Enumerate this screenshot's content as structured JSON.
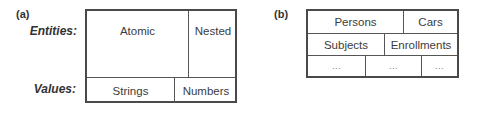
{
  "panel_a": {
    "label": "(a)",
    "row_labels": {
      "entities": "Entities:",
      "values": "Values:"
    },
    "entities": [
      {
        "label": "Atomic"
      },
      {
        "label": "Nested"
      }
    ],
    "values": [
      {
        "label": "Strings"
      },
      {
        "label": "Numbers"
      }
    ]
  },
  "panel_b": {
    "label": "(b)",
    "rows": [
      [
        {
          "label": "Persons"
        },
        {
          "label": "Cars"
        }
      ],
      [
        {
          "label": "Subjects"
        },
        {
          "label": "Enrollments"
        }
      ],
      [
        {
          "label": "..."
        },
        {
          "label": "..."
        },
        {
          "label": "..."
        }
      ]
    ]
  }
}
